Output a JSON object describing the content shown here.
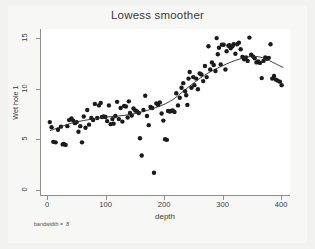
{
  "chart_data": {
    "type": "scatter",
    "title": "Lowess smoother",
    "xlabel": "depth",
    "ylabel": "Wet hole 1",
    "note": "bandwidth = .8",
    "xlim": [
      -12,
      415
    ],
    "ylim": [
      -0.6,
      15.9
    ],
    "xticks": [
      0,
      100,
      200,
      300,
      400
    ],
    "yticks": [
      0,
      5,
      10,
      15
    ],
    "grid": false,
    "legend": "none",
    "marker": {
      "shape": "circle",
      "color": "#1a1a1a",
      "size": 2.2
    },
    "series": [
      {
        "name": "Wet hole 1 observations",
        "type": "scatter",
        "points": [
          [
            3,
            6.7
          ],
          [
            6,
            6.2
          ],
          [
            9,
            4.75
          ],
          [
            13,
            4.7
          ],
          [
            17,
            5.95
          ],
          [
            22,
            6.25
          ],
          [
            25,
            4.5
          ],
          [
            27,
            4.55
          ],
          [
            30,
            4.45
          ],
          [
            33,
            6.3
          ],
          [
            36,
            6.9
          ],
          [
            40,
            7.05
          ],
          [
            43,
            6.85
          ],
          [
            46,
            6.6
          ],
          [
            49,
            6.7
          ],
          [
            52,
            5.75
          ],
          [
            55,
            6.3
          ],
          [
            58,
            4.7
          ],
          [
            61,
            7.25
          ],
          [
            64,
            6.15
          ],
          [
            67,
            7.9
          ],
          [
            70,
            6.45
          ],
          [
            74,
            7.1
          ],
          [
            77,
            6.9
          ],
          [
            80,
            8.5
          ],
          [
            84,
            7.1
          ],
          [
            87,
            8.35
          ],
          [
            90,
            8.6
          ],
          [
            92,
            7.2
          ],
          [
            95,
            7.25
          ],
          [
            98,
            7.2
          ],
          [
            101,
            6.8
          ],
          [
            104,
            8.35
          ],
          [
            107,
            6.5
          ],
          [
            110,
            7.0
          ],
          [
            112,
            6.55
          ],
          [
            115,
            7.3
          ],
          [
            118,
            8.7
          ],
          [
            121,
            7.0
          ],
          [
            124,
            8.1
          ],
          [
            127,
            6.75
          ],
          [
            130,
            8.3
          ],
          [
            133,
            8.25
          ],
          [
            136,
            7.15
          ],
          [
            138,
            8.75
          ],
          [
            140,
            7.6
          ],
          [
            143,
            7.35
          ],
          [
            146,
            8.05
          ],
          [
            149,
            7.85
          ],
          [
            152,
            7.75
          ],
          [
            155,
            7.6
          ],
          [
            157,
            5.1
          ],
          [
            160,
            3.4
          ],
          [
            163,
            7.9
          ],
          [
            166,
            9.3
          ],
          [
            169,
            7.3
          ],
          [
            172,
            6.4
          ],
          [
            175,
            8.2
          ],
          [
            178,
            8.1
          ],
          [
            181,
            1.7
          ],
          [
            185,
            8.55
          ],
          [
            188,
            8.4
          ],
          [
            191,
            8.65
          ],
          [
            194,
            7.55
          ],
          [
            197,
            6.85
          ],
          [
            200,
            5.0
          ],
          [
            203,
            4.95
          ],
          [
            205,
            7.8
          ],
          [
            208,
            7.75
          ],
          [
            210,
            7.8
          ],
          [
            213,
            7.85
          ],
          [
            216,
            7.7
          ],
          [
            219,
            9.55
          ],
          [
            222,
            8.35
          ],
          [
            225,
            9.1
          ],
          [
            228,
            10.1
          ],
          [
            231,
            10.55
          ],
          [
            234,
            9.75
          ],
          [
            236,
            9.35
          ],
          [
            238,
            8.4
          ],
          [
            240,
            11.0
          ],
          [
            242,
            11.65
          ],
          [
            245,
            10.1
          ],
          [
            248,
            11.15
          ],
          [
            250,
            10.35
          ],
          [
            253,
            11.0
          ],
          [
            256,
            9.95
          ],
          [
            259,
            11.5
          ],
          [
            262,
            11.4
          ],
          [
            265,
            10.75
          ],
          [
            268,
            12.25
          ],
          [
            271,
            11.15
          ],
          [
            274,
            14.2
          ],
          [
            277,
            11.9
          ],
          [
            280,
            12.6
          ],
          [
            283,
            12.35
          ],
          [
            286,
            11.75
          ],
          [
            288,
            15.0
          ],
          [
            290,
            13.4
          ],
          [
            292,
            14.05
          ],
          [
            295,
            12.4
          ],
          [
            297,
            14.35
          ],
          [
            300,
            14.35
          ],
          [
            303,
            11.9
          ],
          [
            305,
            13.7
          ],
          [
            308,
            14.25
          ],
          [
            310,
            14.3
          ],
          [
            312,
            14.0
          ],
          [
            315,
            14.2
          ],
          [
            317,
            14.4
          ],
          [
            320,
            13.45
          ],
          [
            323,
            14.4
          ],
          [
            326,
            14.55
          ],
          [
            329,
            13.9
          ],
          [
            332,
            13.15
          ],
          [
            335,
            12.9
          ],
          [
            338,
            13.1
          ],
          [
            341,
            12.75
          ],
          [
            344,
            15.05
          ],
          [
            347,
            13.35
          ],
          [
            350,
            13.2
          ],
          [
            353,
            13.0
          ],
          [
            356,
            12.6
          ],
          [
            359,
            12.7
          ],
          [
            362,
            12.55
          ],
          [
            365,
            11.05
          ],
          [
            368,
            12.75
          ],
          [
            371,
            13.1
          ],
          [
            374,
            12.95
          ],
          [
            377,
            13.05
          ],
          [
            380,
            14.4
          ],
          [
            383,
            11.0
          ],
          [
            386,
            11.25
          ],
          [
            389,
            10.9
          ],
          [
            392,
            10.8
          ],
          [
            396,
            10.7
          ],
          [
            399,
            10.35
          ]
        ]
      },
      {
        "name": "Lowess smooth",
        "type": "line",
        "color": "#2a2a2a",
        "width": 0.9,
        "points": [
          [
            3,
            5.85
          ],
          [
            20,
            6.2
          ],
          [
            40,
            6.6
          ],
          [
            60,
            6.85
          ],
          [
            80,
            7.05
          ],
          [
            100,
            7.2
          ],
          [
            120,
            7.3
          ],
          [
            140,
            7.45
          ],
          [
            160,
            7.7
          ],
          [
            180,
            8.05
          ],
          [
            200,
            8.5
          ],
          [
            215,
            9.0
          ],
          [
            230,
            9.7
          ],
          [
            245,
            10.4
          ],
          [
            260,
            11.05
          ],
          [
            275,
            11.6
          ],
          [
            290,
            12.05
          ],
          [
            305,
            12.45
          ],
          [
            320,
            12.8
          ],
          [
            335,
            13.05
          ],
          [
            348,
            13.2
          ],
          [
            360,
            13.15
          ],
          [
            372,
            12.95
          ],
          [
            384,
            12.6
          ],
          [
            396,
            12.25
          ],
          [
            402,
            12.1
          ]
        ]
      }
    ]
  },
  "axes": {
    "y_tick_labels": [
      "0",
      "5",
      "10",
      "15"
    ],
    "x_tick_labels": [
      "0",
      "100",
      "200",
      "300",
      "400"
    ]
  }
}
